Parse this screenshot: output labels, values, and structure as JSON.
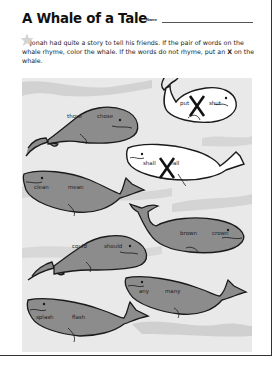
{
  "worksheet": {
    "title": "A Whale of a Tale",
    "name_label": "Name",
    "name_value": "",
    "instructions_parts": {
      "before_x": "Jonah had quite a story to tell his friends. If the pair of words on the whale rhyme, color the whale. If the words do not rhyme, put an ",
      "x_mark": "X",
      "after_x": " on the whale."
    }
  },
  "colors": {
    "colored_whale": "#8c8c8c",
    "uncolored_whale": "#ffffff",
    "outline": "#1a1a1a",
    "scene_background": "#e9e9e9",
    "wave": "#d2d2d2",
    "x_mark": "#111111"
  },
  "whales": [
    {
      "id": 1,
      "word1": "put",
      "word2": "shut",
      "state": "x-marked"
    },
    {
      "id": 2,
      "word1": "those",
      "word2": "chose",
      "state": "colored"
    },
    {
      "id": 3,
      "word1": "shall",
      "word2": "fall",
      "state": "x-marked"
    },
    {
      "id": 4,
      "word1": "clean",
      "word2": "mean",
      "state": "colored"
    },
    {
      "id": 5,
      "word1": "brown",
      "word2": "crown",
      "state": "colored"
    },
    {
      "id": 6,
      "word1": "could",
      "word2": "should",
      "state": "colored"
    },
    {
      "id": 7,
      "word1": "any",
      "word2": "many",
      "state": "colored"
    },
    {
      "id": 8,
      "word1": "splash",
      "word2": "flash",
      "state": "colored"
    }
  ]
}
